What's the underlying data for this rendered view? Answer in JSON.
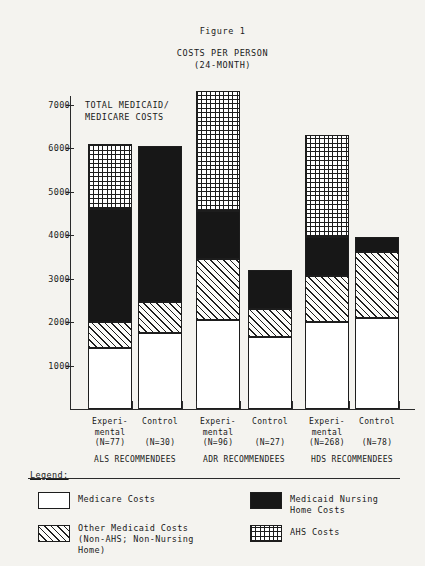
{
  "figure": {
    "number": "Figure 1",
    "title": "COSTS PER PERSON",
    "subtitle": "(24-MONTH)",
    "annotation_line1": "TOTAL MEDICAID/",
    "annotation_line2": "MEDICARE COSTS"
  },
  "legend": {
    "heading": "Legend:",
    "items": [
      {
        "key": "medicare",
        "label": "Medicare Costs",
        "pattern": "white",
        "color": "#ffffff"
      },
      {
        "key": "nursing",
        "label": "Medicaid Nursing Home Costs",
        "pattern": "solid-black",
        "color": "#171717"
      },
      {
        "key": "othermed",
        "label": "Other Medicaid Costs",
        "label_line2": "(Non-AHS; Non-Nursing",
        "label_line3": "Home)",
        "pattern": "diagonal-hatch",
        "color": "#1d1d1d"
      },
      {
        "key": "ahs",
        "label": "AHS Costs",
        "pattern": "cross-grid",
        "color": "#1d1d1d"
      }
    ]
  },
  "chart_data": {
    "type": "bar",
    "subtype": "stacked",
    "title": "COSTS PER PERSON (24-MONTH)",
    "figure_number": "Figure 1",
    "xlabel": "",
    "ylabel": "",
    "ylim": [
      0,
      7600
    ],
    "yticks": [
      1000,
      2000,
      3000,
      4000,
      5000,
      6000,
      7000
    ],
    "ytick_labels": [
      "1000",
      "2000",
      "3000",
      "4000",
      "5000",
      "6000",
      "7000"
    ],
    "grid": false,
    "legend_position": "below-plot",
    "groups": [
      {
        "name": "ALS RECOMMENDEES",
        "bars": [
          {
            "label_line1": "Experi-",
            "label_line2": "mental",
            "label_line3": "(N=77)",
            "n": 77
          },
          {
            "label_line1": "Control",
            "label_line2": "",
            "label_line3": "(N=30)",
            "n": 30
          }
        ]
      },
      {
        "name": "ADR RECOMMENDEES",
        "bars": [
          {
            "label_line1": "Experi-",
            "label_line2": "mental",
            "label_line3": "(N=96)",
            "n": 96
          },
          {
            "label_line1": "Control",
            "label_line2": "",
            "label_line3": "(N=27)",
            "n": 27
          }
        ]
      },
      {
        "name": "HDS RECOMMENDEES",
        "bars": [
          {
            "label_line1": "Experi-",
            "label_line2": "mental",
            "label_line3": "(N=268)",
            "n": 268
          },
          {
            "label_line1": "Control",
            "label_line2": "",
            "label_line3": "(N=78)",
            "n": 78
          }
        ]
      }
    ],
    "categories": [
      "ALS Experimental (N=77)",
      "ALS Control (N=30)",
      "ADR Experimental (N=96)",
      "ADR Control (N=27)",
      "HDS Experimental (N=268)",
      "HDS Control (N=78)"
    ],
    "series": [
      {
        "name": "Medicare Costs",
        "key": "medicare",
        "values": [
          1400,
          1750,
          2050,
          1650,
          2000,
          2100
        ]
      },
      {
        "name": "Other Medicaid Costs (Non-AHS; Non-Nursing Home)",
        "key": "othermed",
        "values": [
          600,
          700,
          1400,
          650,
          1050,
          1500
        ]
      },
      {
        "name": "Medicaid Nursing Home Costs",
        "key": "nursing",
        "values": [
          2600,
          3600,
          1100,
          900,
          900,
          350
        ]
      },
      {
        "name": "AHS Costs",
        "key": "ahs",
        "values": [
          1500,
          0,
          2750,
          0,
          2350,
          0
        ]
      }
    ],
    "totals": [
      6100,
      6050,
      7300,
      3200,
      6300,
      3950
    ]
  }
}
